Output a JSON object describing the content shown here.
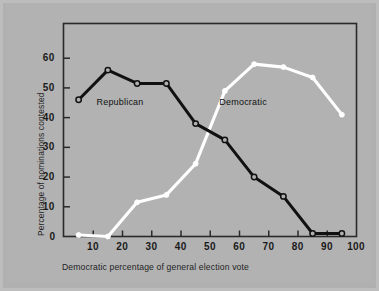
{
  "chart_data": {
    "type": "line",
    "title": "",
    "xlabel": "Democratic percentage of general election vote",
    "ylabel": "Percentage of nominations contested",
    "xlim": [
      0,
      100
    ],
    "ylim": [
      0,
      68
    ],
    "grid": false,
    "legend_position": "inline-annotations",
    "xticks": [
      10,
      20,
      30,
      40,
      50,
      60,
      70,
      80,
      90,
      100
    ],
    "yticks": [
      0,
      10,
      20,
      30,
      40,
      50,
      60
    ],
    "x": [
      5,
      15,
      25,
      35,
      45,
      55,
      65,
      75,
      85,
      95
    ],
    "series": [
      {
        "name": "Republican",
        "color": "#111111",
        "marker": "open-circle",
        "values": [
          46,
          56,
          51.5,
          51.5,
          38,
          32.5,
          20,
          13.5,
          1,
          1
        ]
      },
      {
        "name": "Democratic",
        "color": "#ffffff",
        "marker": "filled-circle",
        "values": [
          0.5,
          0,
          11.5,
          14,
          24.5,
          49,
          58,
          57,
          53.5,
          41
        ]
      }
    ],
    "annotations": [
      {
        "text": "Republican",
        "x": 20,
        "y": 45
      },
      {
        "text": "Democratic",
        "x": 62,
        "y": 45
      }
    ]
  },
  "axis": {
    "x_tick_labels": [
      "10",
      "20",
      "30",
      "40",
      "50",
      "60",
      "70",
      "80",
      "90",
      "100"
    ],
    "y_tick_labels": [
      "60",
      "50",
      "40",
      "30",
      "20",
      "10",
      "0"
    ],
    "x_title": "Democratic percentage of general election vote",
    "y_title": "Percentage of nominations contested"
  },
  "labels": {
    "republican": "Republican",
    "democratic": "Democratic"
  },
  "colors": {
    "background": "#b0b0b0",
    "mat": "#b2b2b2",
    "frame": "#2a2a2a",
    "republican_line": "#111111",
    "democratic_line": "#ffffff",
    "text": "#1a1a1a"
  }
}
